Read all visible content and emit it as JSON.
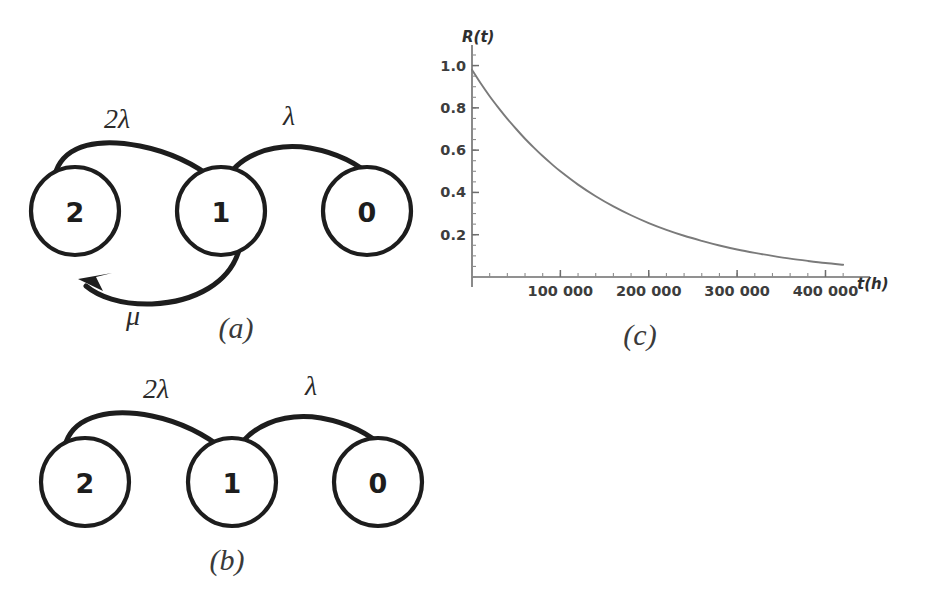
{
  "figure": {
    "background_color": "#ffffff",
    "ink_color": "#1d1d1d",
    "curve_color": "#7a7a7a",
    "axis_color": "#6d6d6d"
  },
  "panel_a": {
    "caption": "(a)",
    "nodes": [
      {
        "id": "state-2",
        "label": "2",
        "cx": 75,
        "cy": 151,
        "r": 44
      },
      {
        "id": "state-1",
        "label": "1",
        "cx": 221,
        "cy": 151,
        "r": 44
      },
      {
        "id": "state-0",
        "label": "0",
        "cx": 367,
        "cy": 151,
        "r": 44
      }
    ],
    "edges": [
      {
        "id": "edge-2-to-1",
        "from": "2",
        "to": "1",
        "rate_label": "2λ",
        "label_x": 117,
        "label_y": 68,
        "direction": "right"
      },
      {
        "id": "edge-1-to-0",
        "from": "1",
        "to": "0",
        "rate_label": "λ",
        "label_x": 289,
        "label_y": 65,
        "direction": "right"
      },
      {
        "id": "edge-1-to-2",
        "from": "1",
        "to": "2",
        "rate_label": "μ",
        "label_x": 133,
        "label_y": 265,
        "direction": "left"
      }
    ]
  },
  "panel_b": {
    "caption": "(b)",
    "nodes": [
      {
        "id": "state-2",
        "label": "2",
        "cx": 85,
        "cy": 122,
        "r": 44
      },
      {
        "id": "state-1",
        "label": "1",
        "cx": 232,
        "cy": 122,
        "r": 44
      },
      {
        "id": "state-0",
        "label": "0",
        "cx": 378,
        "cy": 122,
        "r": 44
      }
    ],
    "edges": [
      {
        "id": "edge-2-to-1",
        "from": "2",
        "to": "1",
        "rate_label": "2λ",
        "label_x": 156,
        "label_y": 38,
        "direction": "right"
      },
      {
        "id": "edge-1-to-0",
        "from": "1",
        "to": "0",
        "rate_label": "λ",
        "label_x": 311,
        "label_y": 35,
        "direction": "right"
      }
    ]
  },
  "panel_c": {
    "caption": "(c)"
  },
  "chart_data": {
    "type": "line",
    "title": "",
    "subtitle": "",
    "xlabel": "t(h)",
    "ylabel": "R(t)",
    "xlim": [
      0,
      430000
    ],
    "ylim": [
      0,
      1.05
    ],
    "grid": false,
    "legend": null,
    "x_tick_labels": [
      "100 000",
      "200 000",
      "300 000",
      "400 000"
    ],
    "x_tick_values": [
      100000,
      200000,
      300000,
      400000
    ],
    "x_minor_step": 20000,
    "y_tick_labels": [
      "0.2",
      "0.4",
      "0.6",
      "0.8",
      "1.0"
    ],
    "y_tick_values": [
      0.2,
      0.4,
      0.6,
      0.8,
      1.0
    ],
    "y_minor_step": 0.05,
    "series": [
      {
        "name": "R(t)",
        "color": "#7a7a7a",
        "x": [
          0,
          10000,
          20000,
          30000,
          40000,
          50000,
          60000,
          70000,
          80000,
          90000,
          100000,
          120000,
          140000,
          160000,
          180000,
          200000,
          220000,
          240000,
          260000,
          280000,
          300000,
          320000,
          340000,
          360000,
          380000,
          400000,
          420000
        ],
        "y": [
          0.98,
          0.915,
          0.855,
          0.8,
          0.748,
          0.7,
          0.654,
          0.612,
          0.572,
          0.535,
          0.5,
          0.437,
          0.382,
          0.334,
          0.292,
          0.255,
          0.223,
          0.195,
          0.171,
          0.149,
          0.13,
          0.114,
          0.1,
          0.087,
          0.076,
          0.066,
          0.058
        ]
      }
    ]
  }
}
